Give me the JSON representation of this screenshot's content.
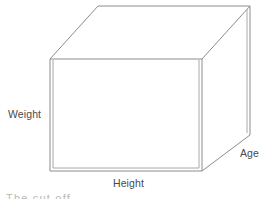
{
  "figure": {
    "type": "3d-cuboid-axes-diagram",
    "background_color": "#ffffff",
    "line_color": "#8c8c8c",
    "text_color": "#4a4a4a",
    "labels": {
      "weight": "Weight",
      "height": "Height",
      "age": "Age"
    },
    "caption_clipped": "The       cut            off",
    "geometry": {
      "front_face": {
        "left_x": 50,
        "right_x": 201,
        "top_y": 59,
        "bottom_y": 171
      },
      "depth_offset": {
        "dx": 48,
        "dy": -53
      },
      "back_top_y": 6,
      "back_right_x": 249,
      "back_bottom_right_y": 135
    }
  }
}
